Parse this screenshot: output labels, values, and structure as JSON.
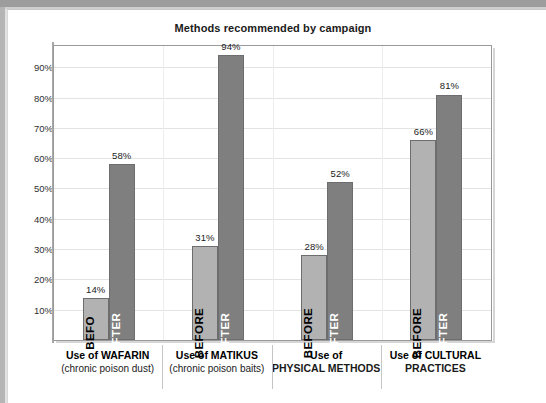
{
  "chart_data": {
    "type": "bar",
    "title": "Methods recommended by campaign",
    "xlabel": "",
    "ylabel": "",
    "ylim": [
      0,
      97
    ],
    "grid": true,
    "legend": "none",
    "categories": [
      "Use of WAFARIN (chronic poison dust)",
      "Use of MATIKUS (chronic poison baits)",
      "Use of PHYSICAL METHODS",
      "Use of CULTURAL PRACTICES"
    ],
    "series": [
      {
        "name": "BEFORE",
        "color": "#b2b2b2",
        "values": [
          14,
          31,
          28,
          66
        ]
      },
      {
        "name": "AFTER",
        "color": "#7f7f7f",
        "values": [
          58,
          94,
          52,
          81
        ]
      }
    ],
    "value_labels": [
      "14%",
      "58%",
      "31%",
      "94%",
      "28%",
      "52%",
      "66%",
      "81%"
    ],
    "yticks": [
      10,
      20,
      30,
      40,
      50,
      60,
      70,
      80,
      90
    ],
    "ytick_labels": [
      "10%",
      "20%",
      "30%",
      "40%",
      "50%",
      "60%",
      "70%",
      "80%",
      "90%"
    ]
  },
  "groups": [
    {
      "line1": "Use of WAFARIN",
      "line2": "(chronic poison dust)",
      "line2_bold": false,
      "before": {
        "label": "BEFORE",
        "label_shown": "BEFO",
        "value": 14,
        "value_label": "14%"
      },
      "after": {
        "label": "AFTER",
        "label_shown": "AFTER",
        "value": 58,
        "value_label": "58%"
      }
    },
    {
      "line1": "Use of MATIKUS",
      "line2": "(chronic poison baits)",
      "line2_bold": false,
      "before": {
        "label": "BEFORE",
        "label_shown": "BEFORE",
        "value": 31,
        "value_label": "31%"
      },
      "after": {
        "label": "AFTER",
        "label_shown": "AFTER",
        "value": 94,
        "value_label": "94%"
      }
    },
    {
      "line1": "Use of",
      "line2": "PHYSICAL METHODS",
      "line2_bold": true,
      "before": {
        "label": "BEFORE",
        "label_shown": "BEFORE",
        "value": 28,
        "value_label": "28%"
      },
      "after": {
        "label": "AFTER",
        "label_shown": "AFTER",
        "value": 52,
        "value_label": "52%"
      }
    },
    {
      "line1": "Use of CULTURAL",
      "line2": "PRACTICES",
      "line2_bold": true,
      "before": {
        "label": "BEFORE",
        "label_shown": "BEFORE",
        "value": 66,
        "value_label": "66%"
      },
      "after": {
        "label": "AFTER",
        "label_shown": "AFTER",
        "value": 81,
        "value_label": "81%"
      }
    }
  ],
  "colors": {
    "before_bar": "#b2b2b2",
    "after_bar": "#7f7f7f",
    "bar_border": "#6d6d6d",
    "grid": "#e3e3e3",
    "plot_border": "#9a9a9a",
    "page_edge": "#9d9d9d"
  }
}
